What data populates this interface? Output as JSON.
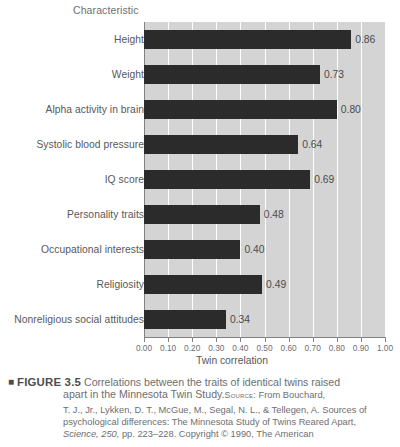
{
  "chart_data": {
    "type": "bar",
    "orientation": "horizontal",
    "title": "",
    "xlabel": "Twin correlation",
    "ylabel": "Characteristic",
    "xlim": [
      0.0,
      1.0
    ],
    "xticks": [
      "0.00",
      "0.10",
      "0.20",
      "0.30",
      "0.40",
      "0.50",
      "0.60",
      "0.70",
      "0.80",
      "0.90",
      "1.00"
    ],
    "grid": "vertical white gridlines at every 0.10",
    "legend": "none",
    "categories": [
      "Height",
      "Weight",
      "Alpha activity in brain",
      "Systolic blood pressure",
      "IQ score",
      "Personality traits",
      "Occupational interests",
      "Religiosity",
      "Nonreligious social attitudes"
    ],
    "values": [
      0.86,
      0.73,
      0.8,
      0.64,
      0.69,
      0.48,
      0.4,
      0.49,
      0.34
    ],
    "value_labels": [
      "0.86",
      "0.73",
      "0.80",
      "0.64",
      "0.69",
      "0.48",
      "0.40",
      "0.49",
      "0.34"
    ],
    "bar_color": "#2b2b2b",
    "plot_background": "#d4d4d4"
  },
  "header": {
    "characteristic_label": "Characteristic"
  },
  "axis": {
    "x_title": "Twin correlation"
  },
  "caption": {
    "marker": "■",
    "figure_number": "FIGURE 3.5",
    "line1": "Correlations between the traits of identical twins raised",
    "line2_main": "apart in the Minnesota Twin Study.",
    "source_label": "Source:",
    "source_after": " From Bouchard,",
    "line3": "T. J., Jr., Lykken, D. T., McGue, M., Segal, N. L., & Tellegen, A. Sources of",
    "line4": "psychological differences: The Minnesota Study of Twins Reared Apart,",
    "line5_journal": "Science,",
    "line5_volume": " 250,",
    "line5_rest": " pp. 223–228. Copyright © 1990, The American"
  }
}
